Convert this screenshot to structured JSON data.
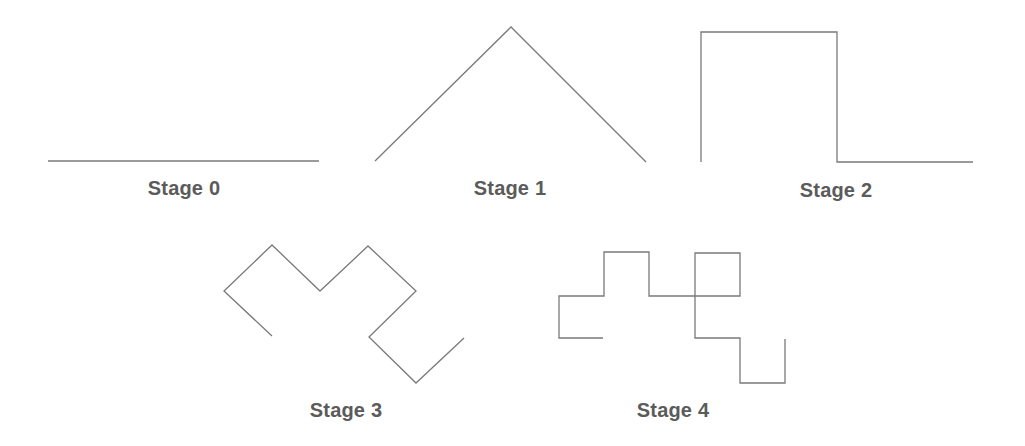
{
  "line_color": "#7a7a7a",
  "label_color": "#5b5b5b",
  "stages": [
    {
      "label": "Stage 0",
      "label_pos": [
        184,
        177
      ],
      "points": [
        [
          48,
          161
        ],
        [
          319,
          161
        ]
      ]
    },
    {
      "label": "Stage 1",
      "label_pos": [
        510,
        177
      ],
      "points": [
        [
          375,
          161
        ],
        [
          511,
          27
        ],
        [
          646,
          162
        ]
      ]
    },
    {
      "label": "Stage 2",
      "label_pos": [
        836,
        179
      ],
      "points": [
        [
          701,
          162
        ],
        [
          701,
          32
        ],
        [
          837,
          32
        ],
        [
          837,
          162
        ],
        [
          973,
          162
        ]
      ]
    },
    {
      "label": "Stage 3",
      "label_pos": [
        346,
        399
      ],
      "points": [
        [
          272,
          336
        ],
        [
          224,
          291
        ],
        [
          272,
          245
        ],
        [
          320,
          291
        ],
        [
          368,
          246
        ],
        [
          416,
          291
        ],
        [
          369,
          337
        ],
        [
          416,
          383
        ],
        [
          464,
          338
        ]
      ]
    },
    {
      "label": "Stage 4",
      "label_pos": [
        673,
        399
      ],
      "points": [
        [
          603,
          338
        ],
        [
          559,
          338
        ],
        [
          559,
          296
        ],
        [
          604,
          296
        ],
        [
          604,
          252
        ],
        [
          649,
          252
        ],
        [
          649,
          296
        ],
        [
          740,
          296
        ],
        [
          740,
          253
        ],
        [
          695,
          253
        ],
        [
          695,
          338
        ],
        [
          740,
          338
        ],
        [
          740,
          383
        ],
        [
          785,
          383
        ],
        [
          785,
          339
        ]
      ]
    }
  ]
}
